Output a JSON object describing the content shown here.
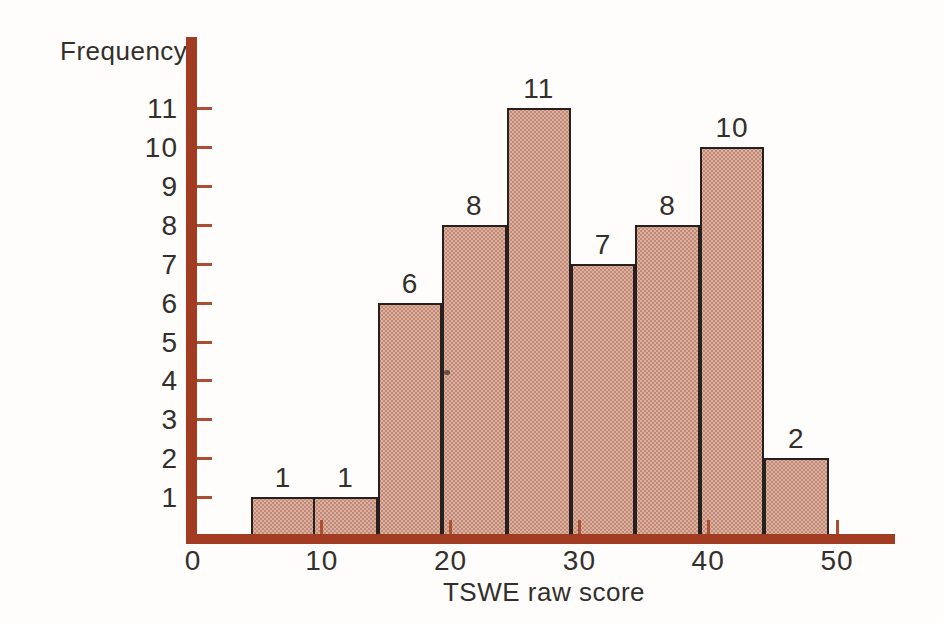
{
  "figure": {
    "background": "#fefdfb"
  },
  "chart_data": {
    "type": "bar",
    "subtype": "histogram",
    "title": "",
    "xlabel": "TSWE raw score",
    "ylabel": "Frequency",
    "bin_edges": [
      4.5,
      9.5,
      14.5,
      19.5,
      24.5,
      29.5,
      34.5,
      39.5,
      44.5,
      49.5
    ],
    "frequencies": [
      1,
      1,
      6,
      8,
      11,
      7,
      8,
      10,
      2
    ],
    "bar_labels": [
      "1",
      "1",
      "6",
      "8",
      "11",
      "7",
      "8",
      "10",
      "2"
    ],
    "x_tick_labels": [
      0,
      10,
      20,
      30,
      40,
      50
    ],
    "x_tick_marks": [
      10,
      20,
      30,
      40,
      50
    ],
    "y_ticks": [
      1,
      2,
      3,
      4,
      5,
      6,
      7,
      8,
      9,
      10,
      11
    ],
    "xlim": [
      0,
      54.5
    ],
    "ylim": [
      0,
      12.8
    ],
    "grid": false,
    "legend": null,
    "colors": {
      "axis": "#a13c22",
      "tick": "#aa4f30",
      "bar_fill": "#dcb1a2",
      "bar_halftone_dot": "#c18a77",
      "bar_border": "#26211d",
      "text": "#332f2b",
      "background": "#fefdfb"
    }
  }
}
